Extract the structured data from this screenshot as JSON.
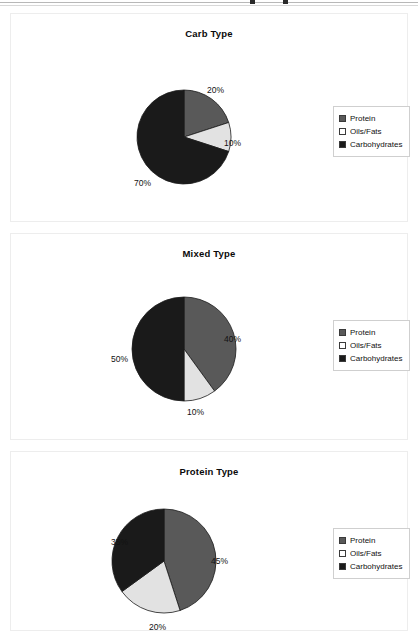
{
  "page": {
    "background_color": "#ffffff",
    "top_rule_visible": true
  },
  "palette": {
    "protein": "#595959",
    "oils_fats": "#e2e2e2",
    "carbohydrates": "#1a1a1a",
    "panel_border": "#ededed",
    "legend_border": "#cfcfcf",
    "text": "#111111"
  },
  "legend": {
    "entries": [
      {
        "label": "Protein",
        "color": "#595959",
        "swatch": "legend-swatch-protein"
      },
      {
        "label": "Oils/Fats",
        "color": "#e2e2e2",
        "swatch": "legend-swatch-oils-fats"
      },
      {
        "label": "Carbohydrates",
        "color": "#1a1a1a",
        "swatch": "legend-swatch-carbohydrates"
      }
    ]
  },
  "chart_data": [
    {
      "type": "pie",
      "title": "Carb Type",
      "categories": [
        "Protein",
        "Oils/Fats",
        "Carbohydrates"
      ],
      "values": [
        20,
        10,
        70
      ],
      "value_labels": [
        "20%",
        "10%",
        "70%"
      ],
      "colors": [
        "#595959",
        "#e2e2e2",
        "#1a1a1a"
      ],
      "legend_position": "right",
      "start_angle_deg": 0,
      "direction": "clockwise",
      "label_positions": [
        {
          "text": "20%",
          "left": 196,
          "top": 71
        },
        {
          "text": "10%",
          "left": 213,
          "top": 124
        },
        {
          "text": "70%",
          "left": 123,
          "top": 164
        }
      ]
    },
    {
      "type": "pie",
      "title": "Mixed Type",
      "categories": [
        "Protein",
        "Oils/Fats",
        "Carbohydrates"
      ],
      "values": [
        40,
        10,
        50
      ],
      "value_labels": [
        "40%",
        "10%",
        "50%"
      ],
      "colors": [
        "#595959",
        "#e2e2e2",
        "#1a1a1a"
      ],
      "legend_position": "right",
      "start_angle_deg": 0,
      "direction": "clockwise",
      "label_positions": [
        {
          "text": "40%",
          "left": 213,
          "top": 100
        },
        {
          "text": "10%",
          "left": 176,
          "top": 173
        },
        {
          "text": "50%",
          "left": 100,
          "top": 120
        }
      ]
    },
    {
      "type": "pie",
      "title": "Protein Type",
      "categories": [
        "Protein",
        "Oils/Fats",
        "Carbohydrates"
      ],
      "values": [
        45,
        20,
        35
      ],
      "value_labels": [
        "45%",
        "20%",
        "35%"
      ],
      "colors": [
        "#595959",
        "#e2e2e2",
        "#1a1a1a"
      ],
      "legend_position": "right",
      "start_angle_deg": 0,
      "direction": "clockwise",
      "label_positions": [
        {
          "text": "45%",
          "left": 200,
          "top": 104
        },
        {
          "text": "20%",
          "left": 138,
          "top": 170
        },
        {
          "text": "35%",
          "left": 100,
          "top": 85
        }
      ]
    }
  ]
}
